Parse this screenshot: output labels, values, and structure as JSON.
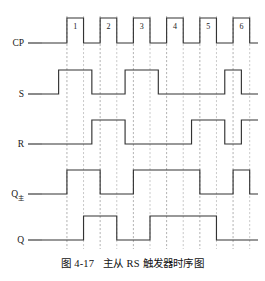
{
  "figure": {
    "caption_number": "图 4-17",
    "caption_text": "主从 RS 触发器时序图",
    "caption_full": "图 4-17　主从 RS 触发器时序图"
  },
  "chart_data": {
    "type": "line",
    "subtype": "digital-timing-diagram",
    "title": "主从 RS 触发器时序图",
    "xlabel": "",
    "ylabel": "",
    "grid": true,
    "legend_position": "left-labels",
    "time_axis": {
      "t_start": 0,
      "t_end": 26,
      "unit": "half-clock-period",
      "x_pixel_start": 42,
      "x_pixel_end": 258,
      "gridlines": [
        3,
        5,
        7,
        9,
        11,
        13,
        15,
        17,
        19,
        21,
        23,
        25
      ],
      "clock_rise_times": [
        3,
        7,
        11,
        15,
        19,
        23
      ],
      "clock_fall_times": [
        5,
        9,
        13,
        17,
        21,
        25
      ]
    },
    "pulse_numbers": [
      "1",
      "2",
      "3",
      "4",
      "5",
      "6"
    ],
    "signal_colors": {
      "waveform": "#333333",
      "gridline": "#9a9a9a",
      "background": "#ffffff"
    },
    "series": [
      {
        "name": "CP",
        "label": "CP",
        "row": 0,
        "levels": [
          {
            "t": 0,
            "v": 0
          },
          {
            "t": 3,
            "v": 1
          },
          {
            "t": 5,
            "v": 0
          },
          {
            "t": 7,
            "v": 1
          },
          {
            "t": 9,
            "v": 0
          },
          {
            "t": 11,
            "v": 1
          },
          {
            "t": 13,
            "v": 0
          },
          {
            "t": 15,
            "v": 1
          },
          {
            "t": 17,
            "v": 0
          },
          {
            "t": 19,
            "v": 1
          },
          {
            "t": 21,
            "v": 0
          },
          {
            "t": 23,
            "v": 1
          },
          {
            "t": 25,
            "v": 0
          },
          {
            "t": 26,
            "v": 0
          }
        ]
      },
      {
        "name": "S",
        "label": "S",
        "row": 1,
        "levels": [
          {
            "t": 0,
            "v": 0
          },
          {
            "t": 2,
            "v": 1
          },
          {
            "t": 6,
            "v": 0
          },
          {
            "t": 10,
            "v": 1
          },
          {
            "t": 14,
            "v": 0
          },
          {
            "t": 22,
            "v": 1
          },
          {
            "t": 24,
            "v": 0
          },
          {
            "t": 26,
            "v": 0
          }
        ]
      },
      {
        "name": "R",
        "label": "R",
        "row": 2,
        "levels": [
          {
            "t": 0,
            "v": 0
          },
          {
            "t": 6,
            "v": 1
          },
          {
            "t": 10,
            "v": 0
          },
          {
            "t": 18,
            "v": 1
          },
          {
            "t": 22,
            "v": 0
          },
          {
            "t": 24,
            "v": 1
          },
          {
            "t": 26,
            "v": 1
          }
        ]
      },
      {
        "name": "Q_master",
        "label": "Q",
        "sublabel": "主",
        "row": 3,
        "levels": [
          {
            "t": 0,
            "v": 0
          },
          {
            "t": 3,
            "v": 1
          },
          {
            "t": 7,
            "v": 0
          },
          {
            "t": 11,
            "v": 1
          },
          {
            "t": 19,
            "v": 0
          },
          {
            "t": 23,
            "v": 1
          },
          {
            "t": 25,
            "v": 0
          },
          {
            "t": 26,
            "v": 0
          }
        ]
      },
      {
        "name": "Q",
        "label": "Q",
        "row": 4,
        "levels": [
          {
            "t": 0,
            "v": 0
          },
          {
            "t": 5,
            "v": 1
          },
          {
            "t": 9,
            "v": 0
          },
          {
            "t": 13,
            "v": 1
          },
          {
            "t": 21,
            "v": 0
          },
          {
            "t": 26,
            "v": 0
          }
        ]
      }
    ]
  }
}
